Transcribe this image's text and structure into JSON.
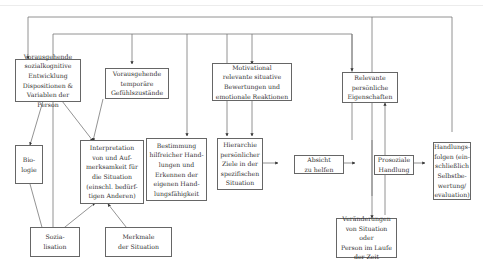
{
  "diagram": {
    "nodes": {
      "dispositionen": "Vorausgehende\nsozialkognitive\nEntwicklung\nDispositionen &\nVariablen der Person",
      "gefuehlszustaende": "Vorausgehende\ntemporäre\nGefühlszustände",
      "motivational": "Motivational\nrelevante situative\nBewertungen und\nemotionale Reaktionen",
      "eigenschaften": "Relevante\npersönliche\nEigenschaften",
      "biologie": "Bio-\nlogie",
      "interpretation": "Interpretation\nvon und Auf-\nmerksamkeit für\ndie Situation\n(einschl. bedürf-\ntigen Anderen)",
      "bestimmung": "Bestimmung\nhilfreicher Hand-\nlungen und\nErkennen der\neigenen Hand-\nlungsfähigkeit",
      "hierarchie": "Hierarchie\npersönlicher\nZiele in der\nspezifischen\nSituation",
      "absicht": "Absicht\nzu helfen",
      "prosoziale": "Prosoziale\nHandlung",
      "handlungsfolgen": "Handlungs-\nfolgen (ein-\nschließlich\nSelbstbe-\nwertung/\nevaluation)",
      "sozialisation": "Sozia-\nlisation",
      "merkmale": "Merkmale\nder Situation",
      "veraenderungen": "Veränderungen\nvon Situation oder\nPerson im Laufe\nder Zeit"
    },
    "colors": {
      "line": "#666666",
      "text": "#333333",
      "background": "#ffffff"
    }
  }
}
